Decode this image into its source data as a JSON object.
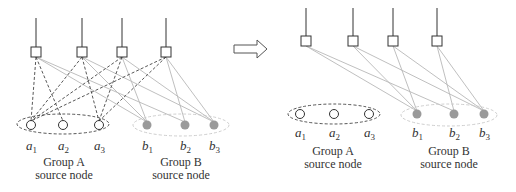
{
  "colors": {
    "black_line": "#333333",
    "gray_line": "#b8b8b8",
    "gray_node": "#9a9a9a",
    "dashed_black": "#444444",
    "dashed_gray": "#c8c8c8"
  },
  "left": {
    "squares": [
      {
        "x": 36,
        "y": 52
      },
      {
        "x": 82,
        "y": 52
      },
      {
        "x": 122,
        "y": 52
      },
      {
        "x": 166,
        "y": 52
      }
    ],
    "stem_top": 18,
    "group_a": {
      "ellipse": {
        "cx": 63,
        "cy": 124,
        "rx": 46,
        "ry": 10
      },
      "nodes": [
        {
          "x": 31,
          "y": 125,
          "name": "a",
          "sub": "1"
        },
        {
          "x": 63,
          "y": 125,
          "name": "a",
          "sub": "2"
        },
        {
          "x": 99,
          "y": 125,
          "name": "a",
          "sub": "3"
        }
      ],
      "title": "Group A",
      "subtitle": "source node",
      "title_x": 64
    },
    "group_b": {
      "ellipse": {
        "cx": 181,
        "cy": 125,
        "rx": 48,
        "ry": 11
      },
      "nodes": [
        {
          "x": 147,
          "y": 125,
          "name": "b",
          "sub": "1"
        },
        {
          "x": 185,
          "y": 125,
          "name": "b",
          "sub": "2"
        },
        {
          "x": 214,
          "y": 125,
          "name": "b",
          "sub": "3"
        }
      ],
      "title": "Group B",
      "subtitle": "source node",
      "title_x": 181
    },
    "dashed_edges": [
      [
        0,
        0
      ],
      [
        0,
        1
      ],
      [
        1,
        0
      ],
      [
        1,
        2
      ],
      [
        2,
        0
      ],
      [
        2,
        2
      ],
      [
        3,
        0
      ],
      [
        3,
        2
      ]
    ],
    "solid_edges": [
      [
        0,
        0
      ],
      [
        0,
        1
      ],
      [
        1,
        0
      ],
      [
        1,
        2
      ],
      [
        2,
        0
      ],
      [
        2,
        2
      ],
      [
        3,
        1
      ],
      [
        3,
        2
      ]
    ],
    "label_y": 150,
    "title_y": 166,
    "subtitle_y": 179
  },
  "right": {
    "squares": [
      {
        "x": 306,
        "y": 41
      },
      {
        "x": 353,
        "y": 41
      },
      {
        "x": 393,
        "y": 41
      },
      {
        "x": 437,
        "y": 41
      }
    ],
    "stem_top": 8,
    "group_a": {
      "ellipse": {
        "cx": 334,
        "cy": 114,
        "rx": 46,
        "ry": 10
      },
      "nodes": [
        {
          "x": 300,
          "y": 114,
          "name": "a",
          "sub": "1"
        },
        {
          "x": 334,
          "y": 114,
          "name": "a",
          "sub": "2"
        },
        {
          "x": 369,
          "y": 114,
          "name": "a",
          "sub": "3"
        }
      ],
      "title": "Group A",
      "subtitle": "source node",
      "title_x": 333
    },
    "group_b": {
      "ellipse": {
        "cx": 449,
        "cy": 115,
        "rx": 48,
        "ry": 11
      },
      "nodes": [
        {
          "x": 417,
          "y": 114,
          "name": "b",
          "sub": "1"
        },
        {
          "x": 454,
          "y": 114,
          "name": "b",
          "sub": "2"
        },
        {
          "x": 484,
          "y": 114,
          "name": "b",
          "sub": "3"
        }
      ],
      "title": "Group B",
      "subtitle": "source node",
      "title_x": 449
    },
    "dashed_edges": [],
    "solid_edges": [
      [
        0,
        0
      ],
      [
        0,
        1
      ],
      [
        1,
        0
      ],
      [
        1,
        2
      ],
      [
        2,
        0
      ],
      [
        2,
        2
      ],
      [
        3,
        1
      ],
      [
        3,
        2
      ]
    ],
    "label_y": 137,
    "title_y": 155,
    "subtitle_y": 168
  },
  "arrow": {
    "shaft_x1": 234,
    "shaft_x2": 257,
    "y": 49,
    "tip_x": 267,
    "half_shaft": 4,
    "half_head": 9
  }
}
